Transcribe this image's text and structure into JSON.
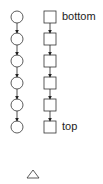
{
  "diagram": {
    "left_chain": {
      "shape": "circle",
      "count": 6,
      "cx": 17,
      "start_y": 17,
      "spacing": 22,
      "radius": 6
    },
    "right_chain": {
      "shape": "square",
      "count": 6,
      "x": 44,
      "start_y": 11,
      "spacing": 22,
      "size": 12
    },
    "labels": {
      "bottom": "bottom",
      "top": "top"
    },
    "extra_shape": "triangle",
    "stroke_color": "#333333"
  }
}
